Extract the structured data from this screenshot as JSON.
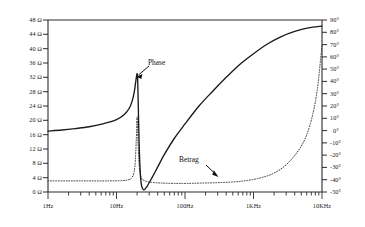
{
  "chart_data": {
    "type": "line",
    "title": "",
    "subtitle": "",
    "xlabel": "",
    "ylabel": "",
    "y2label": "",
    "grid": false,
    "legend_position": "inline-annotations",
    "x_scale": "log",
    "xlim": [
      1,
      10000
    ],
    "x_tick_labels": [
      "1Hz",
      "10Hz",
      "100Hz",
      "1KHz",
      "10KHz"
    ],
    "x_tick_values": [
      1,
      10,
      100,
      1000,
      10000
    ],
    "left_axis": {
      "unit": "Ω",
      "ylim": [
        0,
        48
      ],
      "tick_step": 4,
      "tick_labels": [
        "48 Ω",
        "44 Ω",
        "40 Ω",
        "36 Ω",
        "32 Ω",
        "28 Ω",
        "24 Ω",
        "20 Ω",
        "16 Ω",
        "12 Ω",
        "8 Ω",
        "4 Ω",
        "0 Ω"
      ],
      "tick_values": [
        48,
        44,
        40,
        36,
        32,
        28,
        24,
        20,
        16,
        12,
        8,
        4,
        0
      ]
    },
    "right_axis": {
      "unit": "°",
      "ylim": [
        -50,
        90
      ],
      "tick_step": 10,
      "tick_labels": [
        "90°",
        "80°",
        "70°",
        "60°",
        "50°",
        "40°",
        "30°",
        "20°",
        "10°",
        "0°",
        "-10°",
        "-20°",
        "-30°",
        "-40°",
        "-50°"
      ],
      "tick_values": [
        90,
        80,
        70,
        60,
        50,
        40,
        30,
        20,
        10,
        0,
        -10,
        -20,
        -30,
        -40,
        -50
      ]
    },
    "series": [
      {
        "name": "Phase",
        "style": "solid",
        "color": "#1a1a1a",
        "axis": "left",
        "x": [
          1,
          1.6,
          2.5,
          4,
          6.3,
          10,
          13,
          15.5,
          17,
          18.2,
          19,
          19.6,
          20,
          20.4,
          20.8,
          21.3,
          22,
          23,
          25,
          28,
          33,
          40,
          50,
          70,
          100,
          160,
          250,
          400,
          630,
          1000,
          1600,
          2500,
          4000,
          6300,
          10000
        ],
        "values": [
          17,
          17.3,
          17.7,
          18.2,
          19,
          20.2,
          21.6,
          23.5,
          25.5,
          28,
          30.5,
          32.3,
          33,
          31,
          24,
          15,
          7,
          2.2,
          0.6,
          1.6,
          4,
          7,
          10.5,
          15,
          19,
          24,
          28,
          32,
          35.6,
          38.6,
          41.3,
          43.3,
          44.8,
          45.8,
          46.3
        ]
      },
      {
        "name": "Betrag",
        "style": "dotted",
        "color": "#3a3a3a",
        "axis": "left",
        "x": [
          1,
          2,
          4,
          8,
          14,
          17,
          18.5,
          19.4,
          20,
          20.6,
          21.5,
          23,
          26,
          32,
          45,
          70,
          110,
          180,
          300,
          500,
          800,
          1300,
          2000,
          3000,
          4500,
          6000,
          7500,
          8600,
          9300,
          10000
        ],
        "values": [
          3.1,
          3.1,
          3.1,
          3.1,
          3.3,
          4.2,
          7,
          14,
          21,
          14,
          7,
          4,
          3.1,
          2.7,
          2.5,
          2.4,
          2.4,
          2.5,
          2.6,
          2.8,
          3.2,
          4,
          5.3,
          7.6,
          11.5,
          16,
          22.5,
          29,
          35,
          41
        ]
      }
    ],
    "annotations": [
      {
        "text": "Phase",
        "target_series": "Phase",
        "arrow": "down-left",
        "description": "label with arrow pointing to the resonance peak of the solid curve"
      },
      {
        "text": "Betrag",
        "target_series": "Betrag",
        "arrow": "down-right",
        "description": "label with arrow pointing to the dotted magnitude curve baseline"
      }
    ]
  }
}
